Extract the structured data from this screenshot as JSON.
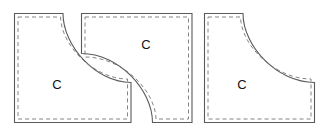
{
  "figure": {
    "background_color": "#ffffff",
    "outline_color": "#5a5a5a",
    "dash_color": "#777777",
    "label_color": "#111111",
    "piece_count": 3,
    "labels": {
      "left": "C",
      "middle": "C",
      "right": "C"
    },
    "pieces": [
      {
        "id": "left-piece",
        "name": "left-curved-tile",
        "label": "C",
        "label_x": 57,
        "label_y": 86,
        "outline_path": "M 14.5 13.5 L 63 13.5 C 63 46 96 82.5 131 82.5 L 131 122.5 L 14.5 122.5 Z",
        "dash_path": "M 18 17 L 60.5 17 C 61.5 47 95 79 127.5 79 L 127.5 119 L 18 119 Z"
      },
      {
        "id": "middle-piece",
        "name": "middle-curved-tile",
        "label": "C",
        "label_x": 146,
        "label_y": 46,
        "outline_path": "M 81.5 13.5 L 192 13.5 L 192 122.5 L 152.5 122.5 C 152.5 90 119 53.5 81.5 53.5 Z",
        "dash_path": "M 85 17 L 188.5 17 L 188.5 119 L 156 119 C 155 89 121 57 85 57 Z"
      },
      {
        "id": "right-piece",
        "name": "right-curved-tile",
        "label": "C",
        "label_x": 242,
        "label_y": 86,
        "outline_path": "M 204.5 13.5 L 243 13.5 C 243 46 277 82.5 314.5 82.5 L 314.5 122.5 L 204.5 122.5 Z",
        "dash_path": "M 208 17 L 240.5 17 C 241.5 47 276 79 311 79 L 311 119 L 208 119 Z"
      }
    ]
  }
}
